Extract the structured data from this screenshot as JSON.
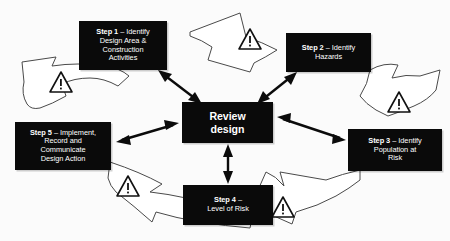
{
  "diagram": {
    "center": {
      "label": "Review\ndesign",
      "name": "review-design"
    },
    "steps": [
      {
        "id": "step1",
        "lead": "Step 1",
        "dash": " – ",
        "rest": "Identify\nDesign Area &\nConstruction\nActivities",
        "full": "Step 1 – Identify Design Area & Construction Activities"
      },
      {
        "id": "step2",
        "lead": "Step 2",
        "dash": " – ",
        "rest": "Identify\nHazards",
        "full": "Step 2 – Identify Hazards"
      },
      {
        "id": "step3",
        "lead": "Step 3",
        "dash": " – ",
        "rest": "Identify\nPopulation at\nRisk",
        "full": "Step 3 – Identify Population at Risk"
      },
      {
        "id": "step4",
        "lead": "Step 4",
        "dash": " – ",
        "rest": "\nLevel of Risk",
        "full": "Step 4 – Level of Risk"
      },
      {
        "id": "step5",
        "lead": "Step 5",
        "dash": " – ",
        "rest": "Implement,\nRecord and\nCommunicate\nDesign Action",
        "full": "Step 5 – Implement, Record and Communicate Design Action"
      }
    ],
    "cycle_arrows": [
      {
        "name": "cycle-arrow-step5-to-step1",
        "icon": "warning-triangle-icon",
        "direction": "left"
      },
      {
        "name": "cycle-arrow-step1-to-step2",
        "icon": "warning-triangle-icon",
        "direction": "right"
      },
      {
        "name": "cycle-arrow-step2-to-step3",
        "icon": "warning-triangle-icon",
        "direction": "down-right"
      },
      {
        "name": "cycle-arrow-step3-to-step4",
        "icon": "warning-triangle-icon",
        "direction": "down-left"
      },
      {
        "name": "cycle-arrow-step4-to-step5",
        "icon": "warning-triangle-icon",
        "direction": "up-left"
      }
    ],
    "spoke_arrows": [
      {
        "name": "spoke-arrow-center-step1",
        "style": "double-headed"
      },
      {
        "name": "spoke-arrow-center-step2",
        "style": "double-headed"
      },
      {
        "name": "spoke-arrow-center-step3",
        "style": "double-headed"
      },
      {
        "name": "spoke-arrow-center-step4",
        "style": "double-headed"
      },
      {
        "name": "spoke-arrow-center-step5",
        "style": "double-headed"
      }
    ],
    "colors": {
      "box_fill": "#0a0a0a",
      "box_text": "#ffffff",
      "arrow_fill": "#0b0b0b",
      "hollow_arrow_stroke": "#4a4a4a",
      "background": "#fbfbfb"
    }
  }
}
